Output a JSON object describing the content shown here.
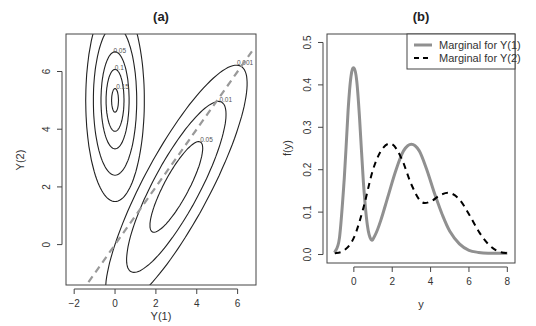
{
  "chart_data": [
    {
      "panel": "(a)",
      "type": "contour",
      "title": "(a)",
      "xlabel": "Y(1)",
      "ylabel": "Y(2)",
      "xlim": [
        -2.4,
        6.9
      ],
      "ylim": [
        -1.4,
        7.3
      ],
      "xticks": [
        -2,
        0,
        2,
        4,
        6
      ],
      "yticks": [
        0,
        2,
        4,
        6
      ],
      "contour_levels": [
        0.001,
        0.01,
        0.05,
        0.1,
        0.15,
        0.2
      ],
      "components": [
        {
          "name": "upper-left mode",
          "center": [
            0.0,
            5.0
          ],
          "sd": [
            0.45,
            1.1
          ],
          "rho": 0.0,
          "labels": [
            "0.001",
            "0.01",
            "0.05",
            "0.1",
            "0.15"
          ]
        },
        {
          "name": "lower-right mode",
          "center": [
            3.0,
            2.0
          ],
          "sd": [
            1.15,
            1.4
          ],
          "rho": 0.85,
          "labels": [
            "0.001",
            "0.01",
            "0.05",
            "0.1",
            "0.15",
            "0.2"
          ]
        }
      ],
      "reference_line": {
        "style": "dashed",
        "color": "#999999",
        "from": [
          -1.3,
          -1.3
        ],
        "to": [
          6.7,
          6.7
        ],
        "label": "Y(2) = Y(1)"
      }
    },
    {
      "panel": "(b)",
      "type": "line",
      "title": "(b)",
      "xlabel": "y",
      "ylabel": "f(y)",
      "xlim": [
        -1.4,
        8.4
      ],
      "ylim": [
        -0.02,
        0.52
      ],
      "xticks": [
        0,
        2,
        4,
        6,
        8
      ],
      "yticks": [
        0.0,
        0.1,
        0.2,
        0.3,
        0.4,
        0.5
      ],
      "legend_position": "top-right",
      "series": [
        {
          "name": "Marginal for Y(1)",
          "style": "solid",
          "color": "#909090",
          "x": [
            -1.0,
            -0.75,
            -0.5,
            -0.3,
            -0.15,
            0.0,
            0.15,
            0.3,
            0.5,
            0.7,
            0.9,
            1.1,
            1.4,
            1.8,
            2.2,
            2.6,
            3.0,
            3.4,
            3.8,
            4.2,
            4.6,
            5.0,
            5.5,
            6.0,
            6.5,
            7.0,
            8.0
          ],
          "values": [
            0.005,
            0.04,
            0.18,
            0.34,
            0.42,
            0.44,
            0.41,
            0.32,
            0.17,
            0.07,
            0.035,
            0.045,
            0.08,
            0.14,
            0.2,
            0.245,
            0.26,
            0.245,
            0.2,
            0.145,
            0.095,
            0.055,
            0.025,
            0.01,
            0.005,
            0.003,
            0.003
          ]
        },
        {
          "name": "Marginal for Y(2)",
          "style": "dashed",
          "color": "#000000",
          "x": [
            -1.0,
            -0.5,
            0.0,
            0.5,
            1.0,
            1.5,
            2.0,
            2.5,
            3.0,
            3.5,
            4.0,
            4.5,
            5.0,
            5.5,
            6.0,
            6.5,
            7.0,
            7.5,
            8.0
          ],
          "values": [
            0.003,
            0.01,
            0.04,
            0.11,
            0.2,
            0.25,
            0.26,
            0.225,
            0.165,
            0.125,
            0.125,
            0.14,
            0.145,
            0.13,
            0.095,
            0.055,
            0.025,
            0.008,
            0.003
          ]
        }
      ]
    }
  ],
  "panels": {
    "a": {
      "title": "(a)",
      "xlabel": "Y(1)",
      "ylabel": "Y(2)"
    },
    "b": {
      "title": "(b)",
      "xlabel": "y",
      "ylabel": "f(y)",
      "legend": [
        "Marginal for Y(1)",
        "Marginal for Y(2)"
      ]
    }
  }
}
